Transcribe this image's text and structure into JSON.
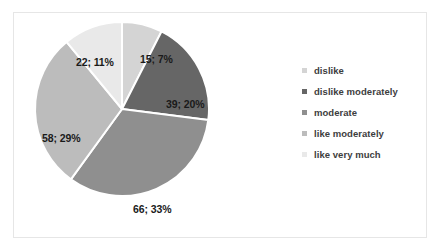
{
  "chart_data": {
    "type": "pie",
    "title": "",
    "categories": [
      "dislike",
      "dislike moderately",
      "moderate",
      "like moderately",
      "like very much"
    ],
    "values": [
      15,
      39,
      66,
      58,
      22
    ],
    "percents": [
      7,
      20,
      33,
      29,
      11
    ],
    "total": 200,
    "legend_position": "right",
    "grid": false,
    "start_angle": 0,
    "direction": "clockwise",
    "slice_colors": [
      "#d4d4d4",
      "#666666",
      "#8f8f8f",
      "#bcbcbc",
      "#e9e9e9"
    ],
    "separator_color": "#ffffff",
    "label_text_color": "#1a1a1a",
    "labels": [
      {
        "text": "15; 7%",
        "value": 15,
        "percent": 7,
        "category": "dislike"
      },
      {
        "text": "39; 20%",
        "value": 39,
        "percent": 20,
        "category": "dislike moderately"
      },
      {
        "text": "66; 33%",
        "value": 66,
        "percent": 33,
        "category": "moderate"
      },
      {
        "text": "58; 29%",
        "value": 58,
        "percent": 29,
        "category": "like moderately"
      },
      {
        "text": "22; 11%",
        "value": 22,
        "percent": 11,
        "category": "like very much"
      }
    ]
  },
  "legend": {
    "items": [
      {
        "label": "dislike",
        "color": "#d4d4d4"
      },
      {
        "label": "dislike moderately",
        "color": "#666666"
      },
      {
        "label": " moderate",
        "color": "#8f8f8f"
      },
      {
        "label": "like moderately",
        "color": "#bcbcbc"
      },
      {
        "label": "like very much",
        "color": "#e9e9e9"
      }
    ]
  },
  "frame": {
    "border_color": "#e6e6e6",
    "background_color": "#ffffff"
  }
}
